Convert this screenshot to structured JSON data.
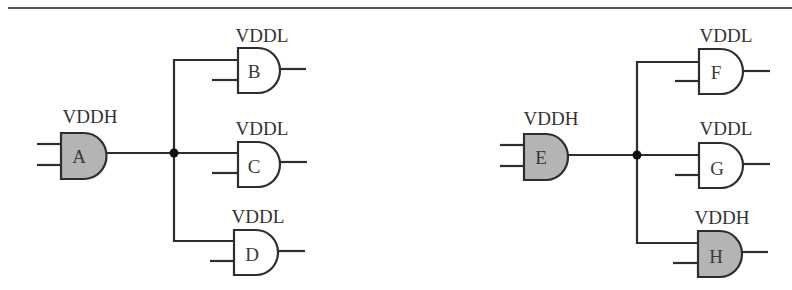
{
  "colors": {
    "high_voltage_fill": "#b4b4b4",
    "low_voltage_fill": "#ffffff",
    "stroke": "#2e2e2e"
  },
  "circuits": [
    {
      "name": "left",
      "driver": {
        "id": "A",
        "supply": "VDDH"
      },
      "loads": [
        {
          "id": "B",
          "supply": "VDDL"
        },
        {
          "id": "C",
          "supply": "VDDL"
        },
        {
          "id": "D",
          "supply": "VDDL"
        }
      ]
    },
    {
      "name": "right",
      "driver": {
        "id": "E",
        "supply": "VDDH"
      },
      "loads": [
        {
          "id": "F",
          "supply": "VDDL"
        },
        {
          "id": "G",
          "supply": "VDDL"
        },
        {
          "id": "H",
          "supply": "VDDH"
        }
      ]
    }
  ]
}
